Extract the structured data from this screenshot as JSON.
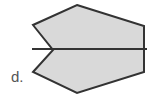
{
  "figure": {
    "label": "d.",
    "shape": {
      "name": "concave hexagon with line of symmetry",
      "points": [
        [
          77,
          5
        ],
        [
          144,
          26
        ],
        [
          144,
          72
        ],
        [
          77,
          93
        ],
        [
          33,
          72
        ],
        [
          53,
          50
        ],
        [
          33,
          25
        ]
      ],
      "fill": "#d9d9d9",
      "stroke": "#333333"
    },
    "symmetry_line": {
      "x1": 32,
      "y1": 49,
      "x2": 147,
      "y2": 49,
      "stroke": "#333333"
    }
  }
}
